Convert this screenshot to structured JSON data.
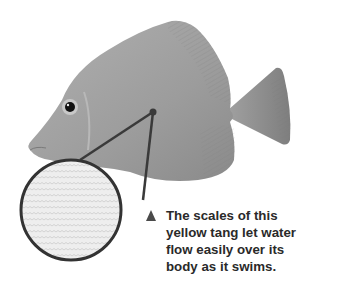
{
  "figure": {
    "inset": "magnified scales",
    "caption_marker": "triangle-pointer",
    "caption_lines": [
      "The scales of this",
      "yellow tang let water",
      "flow easily over its",
      "body as it swims."
    ]
  },
  "colors": {
    "body": "#9a9a9a",
    "fin": "#8c8c8c",
    "outline": "#3a3a3a",
    "text": "#2a2a2a",
    "inset_bg": "#e8e8e8"
  }
}
